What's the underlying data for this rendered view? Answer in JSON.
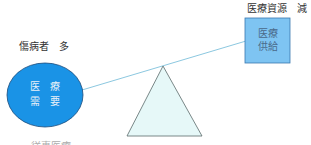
{
  "diagram": {
    "left": {
      "label": "傷病者　多",
      "shape_text_line1": "医　療",
      "shape_text_line2": "需　要",
      "fill_color": "#1a93e6",
      "stroke_color": "#1a4a7a"
    },
    "right": {
      "label": "医療資源　減",
      "shape_text_line1": "医療",
      "shape_text_line2": "供給",
      "fill_color": "#7ec4f2",
      "stroke_color": "#3a78b0"
    },
    "fulcrum": {
      "fill_color": "#e6f8f8",
      "stroke_color": "#5a6a6a"
    },
    "beam": {
      "color": "#8cc8e0"
    },
    "bottom_partial_text": "・・ 従事医療"
  }
}
